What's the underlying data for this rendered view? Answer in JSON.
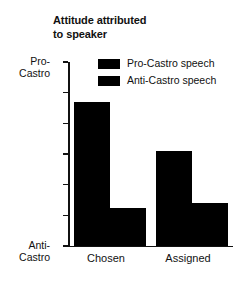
{
  "chart_data": {
    "type": "bar",
    "title": "Attitude attributed\nto speaker",
    "xlabel": "",
    "ylabel": "",
    "categories": [
      "Chosen",
      "Assigned"
    ],
    "series": [
      {
        "name": "Pro-Castro speech",
        "values": [
          57,
          41
        ]
      },
      {
        "name": "Anti-Castro speech",
        "values": [
          22.5,
          24
        ]
      }
    ],
    "ylim": [
      10,
      70
    ],
    "yticks": [
      10,
      20,
      30,
      40,
      50,
      60,
      70
    ],
    "ytick_labels": [
      "10",
      "20",
      "30",
      "40",
      "50",
      "60",
      "70"
    ],
    "axis_pole_high": "Pro-\nCastro",
    "axis_pole_low": "Anti-\nCastro",
    "grid": false,
    "legend_position": "upper center",
    "bar_color": "#000000"
  },
  "caption": {
    "fragment": ""
  }
}
